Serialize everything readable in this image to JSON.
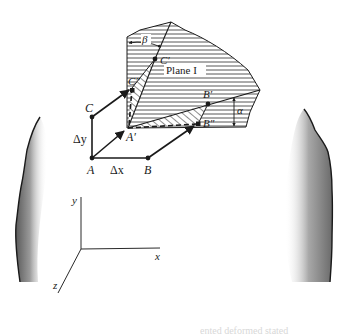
{
  "figure": {
    "plane_label": "Plane I",
    "angle_labels": {
      "alpha": "α",
      "beta": "β"
    },
    "point_labels": {
      "A": "A",
      "B": "B",
      "C": "C",
      "A_prime": "A′",
      "B_prime": "B′",
      "B_double_prime": "B″",
      "C_prime": "C′",
      "C_double_prime": "C″"
    },
    "increment_labels": {
      "dx": "Δx",
      "dy": "Δy"
    },
    "axes_labels": {
      "x": "x",
      "y": "y",
      "z": "z"
    }
  },
  "footer": {
    "text": "ented    deformed    stated"
  },
  "colors": {
    "ink": "#1a1a1a",
    "hatch": "#2a2a2a",
    "background": "#ffffff",
    "shade_dark": "#6e6e6e"
  }
}
